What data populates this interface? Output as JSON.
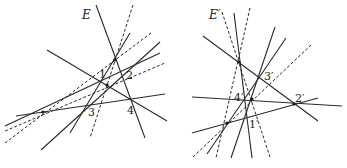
{
  "figures": [
    {
      "id": "left",
      "title": "E",
      "point_labels": [
        {
          "text": "1",
          "x": 99,
          "y": 78
        },
        {
          "text": "2",
          "x": 126,
          "y": 79
        },
        {
          "text": "3",
          "x": 88,
          "y": 116
        },
        {
          "text": "4",
          "x": 127,
          "y": 114
        }
      ],
      "solid_lines": [
        [
          96,
          5,
          145,
          138
        ],
        [
          47,
          50,
          167,
          121
        ],
        [
          16,
          116,
          165,
          94
        ],
        [
          41,
          150,
          160,
          42
        ],
        [
          70,
          133,
          130,
          33
        ],
        [
          5,
          126,
          160,
          53
        ]
      ],
      "dashed_lines": [
        [
          133,
          5,
          90,
          138
        ],
        [
          5,
          143,
          151,
          33
        ],
        [
          5,
          131,
          165,
          63
        ]
      ],
      "points": [
        [
          115,
          60
        ],
        [
          43,
          112
        ],
        [
          107,
          85
        ]
      ]
    },
    {
      "id": "right",
      "title": "E′",
      "point_labels": [
        {
          "text": "3′",
          "x": 264,
          "y": 80
        },
        {
          "text": "2′",
          "x": 295,
          "y": 102
        },
        {
          "text": "4′",
          "x": 234,
          "y": 101
        },
        {
          "text": "1′",
          "x": 249,
          "y": 128
        }
      ],
      "solid_lines": [
        [
          234,
          13,
          252,
          158
        ],
        [
          203,
          36,
          318,
          121
        ],
        [
          192,
          97,
          342,
          106
        ],
        [
          192,
          133,
          318,
          98
        ],
        [
          231,
          158,
          275,
          27
        ],
        [
          207,
          154,
          286,
          38
        ]
      ],
      "dashed_lines": [
        [
          222,
          12,
          270,
          157
        ],
        [
          250,
          8,
          216,
          158
        ],
        [
          193,
          157,
          311,
          45
        ]
      ],
      "points": [
        [
          239,
          62
        ],
        [
          227,
          123
        ],
        [
          252,
          99
        ],
        [
          294,
          104
        ]
      ]
    }
  ]
}
